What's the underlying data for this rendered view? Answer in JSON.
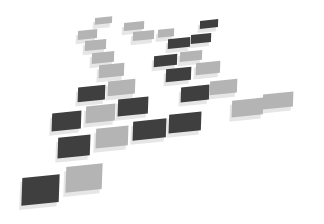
{
  "image": {
    "description": "Abstract arrangement of floating square tiles in perspective, dark gray and light gray, on white background",
    "background": "#ffffff",
    "colors": {
      "dark": "#3f3f3f",
      "light": "#b4b4b4",
      "shadow": "#e6e6e6"
    }
  },
  "tiles": [
    {
      "x": 95,
      "y": 17,
      "w": 17,
      "h": 7,
      "shade": "light",
      "skew": -8
    },
    {
      "x": 124,
      "y": 22,
      "w": 20,
      "h": 8,
      "shade": "light",
      "skew": -8
    },
    {
      "x": 200,
      "y": 20,
      "w": 18,
      "h": 8,
      "shade": "dark",
      "skew": -8
    },
    {
      "x": 78,
      "y": 30,
      "w": 19,
      "h": 9,
      "shade": "light",
      "skew": -8
    },
    {
      "x": 133,
      "y": 31,
      "w": 21,
      "h": 9,
      "shade": "light",
      "skew": -8
    },
    {
      "x": 158,
      "y": 29,
      "w": 16,
      "h": 8,
      "shade": "light",
      "skew": -8
    },
    {
      "x": 191,
      "y": 34,
      "w": 20,
      "h": 9,
      "shade": "dark",
      "skew": -8
    },
    {
      "x": 168,
      "y": 38,
      "w": 22,
      "h": 10,
      "shade": "dark",
      "skew": -8
    },
    {
      "x": 85,
      "y": 40,
      "w": 21,
      "h": 10,
      "shade": "light",
      "skew": -8
    },
    {
      "x": 180,
      "y": 51,
      "w": 22,
      "h": 10,
      "shade": "light",
      "skew": -8
    },
    {
      "x": 154,
      "y": 55,
      "w": 23,
      "h": 11,
      "shade": "dark",
      "skew": -8
    },
    {
      "x": 92,
      "y": 52,
      "w": 22,
      "h": 11,
      "shade": "light",
      "skew": -8
    },
    {
      "x": 196,
      "y": 62,
      "w": 24,
      "h": 12,
      "shade": "light",
      "skew": -8
    },
    {
      "x": 166,
      "y": 68,
      "w": 25,
      "h": 13,
      "shade": "dark",
      "skew": -8
    },
    {
      "x": 99,
      "y": 64,
      "w": 25,
      "h": 13,
      "shade": "light",
      "skew": -8
    },
    {
      "x": 210,
      "y": 80,
      "w": 27,
      "h": 14,
      "shade": "light",
      "skew": -8
    },
    {
      "x": 181,
      "y": 86,
      "w": 28,
      "h": 15,
      "shade": "dark",
      "skew": -8
    },
    {
      "x": 108,
      "y": 80,
      "w": 27,
      "h": 15,
      "shade": "light",
      "skew": -8
    },
    {
      "x": 78,
      "y": 86,
      "w": 27,
      "h": 15,
      "shade": "dark",
      "skew": -8
    },
    {
      "x": 263,
      "y": 93,
      "w": 30,
      "h": 15,
      "shade": "light",
      "skew": -8
    },
    {
      "x": 232,
      "y": 99,
      "w": 31,
      "h": 17,
      "shade": "light",
      "skew": -8
    },
    {
      "x": 118,
      "y": 98,
      "w": 30,
      "h": 17,
      "shade": "dark",
      "skew": -8
    },
    {
      "x": 86,
      "y": 105,
      "w": 29,
      "h": 17,
      "shade": "light",
      "skew": -8
    },
    {
      "x": 52,
      "y": 112,
      "w": 29,
      "h": 18,
      "shade": "dark",
      "skew": -8
    },
    {
      "x": 169,
      "y": 113,
      "w": 32,
      "h": 19,
      "shade": "dark",
      "skew": -8
    },
    {
      "x": 133,
      "y": 120,
      "w": 33,
      "h": 19,
      "shade": "dark",
      "skew": -8
    },
    {
      "x": 96,
      "y": 127,
      "w": 32,
      "h": 20,
      "shade": "light",
      "skew": -8
    },
    {
      "x": 58,
      "y": 136,
      "w": 32,
      "h": 21,
      "shade": "dark",
      "skew": -8
    },
    {
      "x": 66,
      "y": 165,
      "w": 36,
      "h": 26,
      "shade": "light",
      "skew": -8
    },
    {
      "x": 22,
      "y": 176,
      "w": 37,
      "h": 28,
      "shade": "dark",
      "skew": -8
    }
  ]
}
